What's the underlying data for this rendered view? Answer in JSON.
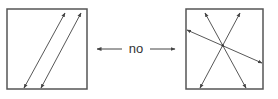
{
  "diagram": {
    "connector_label": "no",
    "colors": {
      "box_stroke": "#555555",
      "line_stroke": "#444444",
      "text": "#333333",
      "background": "#ffffff"
    },
    "left_panel": {
      "description": "square with two parallel double-headed diagonal arrows",
      "box": {
        "x": 7,
        "y": 9,
        "w": 80,
        "h": 80
      },
      "arrows": [
        {
          "x1": 24,
          "y1": 88,
          "x2": 65,
          "y2": 13
        },
        {
          "x1": 41,
          "y1": 88,
          "x2": 81,
          "y2": 13
        }
      ]
    },
    "right_panel": {
      "description": "square with three double-headed arrows crossing at a central point",
      "box": {
        "x": 186,
        "y": 9,
        "w": 77,
        "h": 80
      },
      "arrows": [
        {
          "x1": 205,
          "y1": 13,
          "x2": 246,
          "y2": 88
        },
        {
          "x1": 240,
          "y1": 13,
          "x2": 200,
          "y2": 88
        },
        {
          "x1": 187,
          "y1": 30,
          "x2": 262,
          "y2": 63
        }
      ]
    },
    "connector": {
      "left_arrow": {
        "x1": 122,
        "y1": 49,
        "x2": 97,
        "y2": 49
      },
      "right_arrow": {
        "x1": 150,
        "y1": 49,
        "x2": 175,
        "y2": 49
      },
      "label_x": 136,
      "label_y": 53
    }
  }
}
